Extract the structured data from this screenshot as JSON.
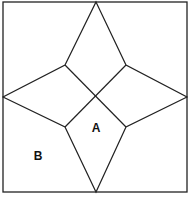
{
  "diagram": {
    "type": "geometric-star-in-square",
    "frame": {
      "x": 3,
      "y": 2,
      "width": 184,
      "height": 190
    },
    "stroke_color": "#222222",
    "background": "#ffffff",
    "points": {
      "top": [
        96,
        2
      ],
      "right": [
        187,
        97
      ],
      "bottom": [
        96,
        192
      ],
      "left": [
        3,
        97
      ],
      "inner_tl": [
        65,
        65
      ],
      "inner_tr": [
        126,
        65
      ],
      "inner_br": [
        126,
        127
      ],
      "inner_bl": [
        65,
        127
      ],
      "center": [
        96,
        97
      ]
    },
    "labels": [
      {
        "id": "A",
        "text": "A",
        "x": 96,
        "y": 132
      },
      {
        "id": "B",
        "text": "B",
        "x": 38,
        "y": 160
      }
    ]
  }
}
